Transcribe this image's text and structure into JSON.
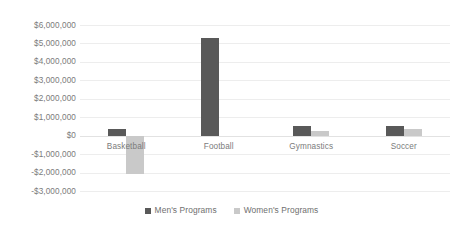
{
  "chart_data": {
    "type": "bar",
    "title": "",
    "subtitle": "",
    "xlabel": "",
    "ylabel": "",
    "categories": [
      "Basketball",
      "Football",
      "Gymnastics",
      "Soccer"
    ],
    "series": [
      {
        "name": "Men's Programs",
        "color": "#595959",
        "values": [
          350000,
          5300000,
          500000,
          500000
        ]
      },
      {
        "name": "Women's Programs",
        "color": "#c9c9c9",
        "values": [
          -2100000,
          0,
          250000,
          350000
        ]
      }
    ],
    "ylim": [
      -3000000,
      6000000
    ],
    "ytick_values": [
      6000000,
      5000000,
      4000000,
      3000000,
      2000000,
      1000000,
      0,
      -1000000,
      -2000000,
      -3000000
    ],
    "ytick_labels": [
      "$6,000,000",
      "$5,000,000",
      "$4,000,000",
      "$3,000,000",
      "$2,000,000",
      "$1,000,000",
      "$0",
      "-$1,000,000",
      "-$2,000,000",
      "-$3,000,000"
    ],
    "grid": true,
    "grid_color": "#ededed",
    "legend_position": "bottom",
    "legend": [
      "Men's Programs",
      "Women's Programs"
    ],
    "background": "#ffffff",
    "axis_label_color": "#7b7b7b"
  }
}
